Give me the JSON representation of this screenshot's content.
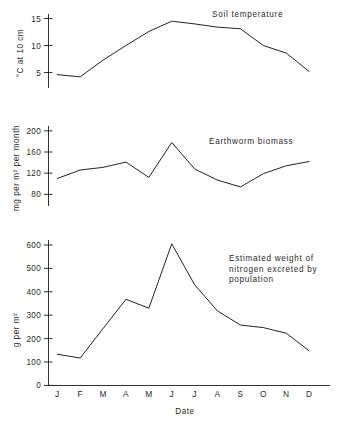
{
  "figure": {
    "xlabel": "Date",
    "months": [
      "J",
      "F",
      "M",
      "A",
      "M",
      "J",
      "J",
      "A",
      "S",
      "O",
      "N",
      "D"
    ]
  },
  "chart_data": [
    {
      "type": "line",
      "title": "Soil temperature",
      "xlabel": "Date",
      "ylabel": "°C at 10 cm",
      "categories": [
        "J",
        "F",
        "M",
        "A",
        "M",
        "J",
        "J",
        "A",
        "S",
        "O",
        "N",
        "D"
      ],
      "values": [
        4.6,
        4.2,
        7.3,
        10.0,
        12.6,
        14.5,
        14.0,
        13.4,
        13.1,
        10.0,
        8.6,
        5.2
      ],
      "yticks": [
        5,
        10,
        15
      ],
      "ylim": [
        2.5,
        16.5
      ],
      "grid": false,
      "legend": "none"
    },
    {
      "type": "line",
      "title": "Earthworm biomass",
      "xlabel": "Date",
      "ylabel": "mg per m² per month",
      "categories": [
        "J",
        "F",
        "M",
        "A",
        "M",
        "J",
        "J",
        "A",
        "S",
        "O",
        "N",
        "D"
      ],
      "values": [
        110,
        126,
        131,
        141,
        112,
        178,
        128,
        107,
        94,
        119,
        134,
        142
      ],
      "yticks": [
        80,
        120,
        160,
        200
      ],
      "ylim": [
        70,
        212
      ],
      "grid": false,
      "legend": "none"
    },
    {
      "type": "line",
      "title": "Estimated weight of nitrogen excreted by population",
      "title_lines": [
        "Estimated weight of",
        "nitrogen excreted by",
        "population"
      ],
      "xlabel": "Date",
      "ylabel": "g per m²",
      "categories": [
        "J",
        "F",
        "M",
        "A",
        "M",
        "J",
        "J",
        "A",
        "S",
        "O",
        "N",
        "D"
      ],
      "values": [
        133,
        117,
        243,
        368,
        330,
        605,
        430,
        318,
        258,
        247,
        223,
        148
      ],
      "yticks": [
        0,
        100,
        200,
        300,
        400,
        500,
        600
      ],
      "ylim": [
        0,
        640
      ],
      "grid": false,
      "legend": "none"
    }
  ],
  "colors": {
    "line": "#232323",
    "axis": "#1d1d1d",
    "text": "#2a2a2a",
    "background": "#ffffff"
  }
}
